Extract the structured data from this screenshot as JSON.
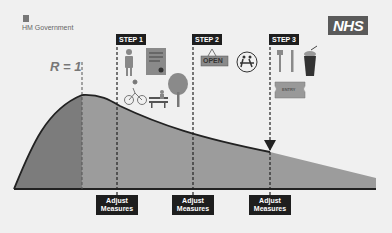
{
  "header": {
    "government_label": "HM Government",
    "nhs_logo": "NHS"
  },
  "chart": {
    "r_label": "R = 1",
    "steps": [
      {
        "label": "STEP 1",
        "icons": [
          "person-icon",
          "document-icon",
          "cyclist-icon",
          "park-bench-icon",
          "tree-icon"
        ]
      },
      {
        "label": "STEP 2",
        "icons": [
          "open-sign-icon",
          "school-children-icon"
        ],
        "open_sign_text": "OPEN"
      },
      {
        "label": "STEP 3",
        "icons": [
          "cutlery-icon",
          "drink-cup-icon",
          "entry-ticket-icon"
        ],
        "ticket_text": "ENTRY"
      }
    ],
    "adjust_labels": [
      {
        "line1": "Adjust",
        "line2": "Measures"
      },
      {
        "line1": "Adjust",
        "line2": "Measures"
      },
      {
        "line1": "Adjust",
        "line2": "Measures"
      }
    ]
  },
  "colors": {
    "background": "#f0f0f0",
    "curve_fill_dark": "#7a7a7a",
    "curve_fill_light": "#9a9a9a",
    "label_bg": "#1e1e1e"
  }
}
